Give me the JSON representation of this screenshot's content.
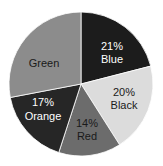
{
  "chart_data": {
    "type": "pie",
    "title": "",
    "categories": [
      "Blue",
      "Black",
      "Red",
      "Orange",
      "Green"
    ],
    "values": [
      21,
      20,
      14,
      17,
      28
    ],
    "labels": [
      "21%\nBlue",
      "20%\nBlack",
      "14%\nRed",
      "17%\nOrange",
      "Green"
    ],
    "start_angle": "12 o'clock, clockwise",
    "colors": [
      "#1c1c1c",
      "#dcdcdc",
      "#6c6c6c",
      "#262626",
      "#8c8c8c"
    ],
    "label_colors": [
      "#ffffff",
      "#1a1a1a",
      "#1a1a1a",
      "#ffffff",
      "#1a1a1a"
    ]
  },
  "slices": [
    {
      "name": "Blue",
      "pct_text": "21%",
      "label": "Blue"
    },
    {
      "name": "Black",
      "pct_text": "20%",
      "label": "Black"
    },
    {
      "name": "Red",
      "pct_text": "14%",
      "label": "Red"
    },
    {
      "name": "Orange",
      "pct_text": "17%",
      "label": "Orange"
    },
    {
      "name": "Green",
      "pct_text": "",
      "label": "Green"
    }
  ]
}
